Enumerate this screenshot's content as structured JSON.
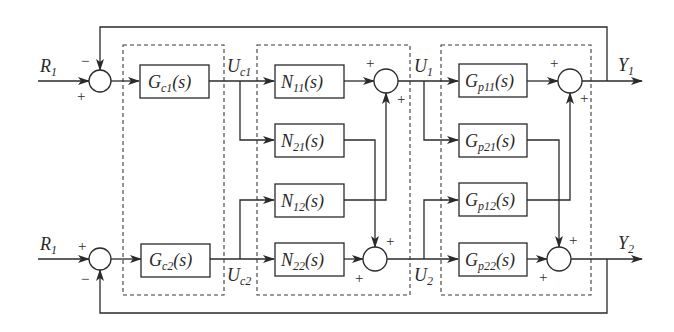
{
  "inputs": [
    {
      "id": "r1_top",
      "main": "R",
      "sub": "1"
    },
    {
      "id": "r1_bottom",
      "main": "R",
      "sub": "1"
    }
  ],
  "outputs": [
    {
      "id": "y1",
      "main": "Y",
      "sub": "1"
    },
    {
      "id": "y2",
      "main": "Y",
      "sub": "2"
    }
  ],
  "signals": {
    "uc1": {
      "main": "U",
      "sub": "c1"
    },
    "uc2": {
      "main": "U",
      "sub": "c2"
    },
    "u1": {
      "main": "U",
      "sub": "1"
    },
    "u2": {
      "main": "U",
      "sub": "2"
    }
  },
  "controller_blocks": [
    {
      "main": "G",
      "sub": "c1",
      "arg": "(s)"
    },
    {
      "main": "G",
      "sub": "c2",
      "arg": "(s)"
    }
  ],
  "decoupler_blocks": [
    {
      "main": "N",
      "sub": "11",
      "arg": "(s)"
    },
    {
      "main": "N",
      "sub": "21",
      "arg": "(s)"
    },
    {
      "main": "N",
      "sub": "12",
      "arg": "(s)"
    },
    {
      "main": "N",
      "sub": "22",
      "arg": "(s)"
    }
  ],
  "plant_blocks": [
    {
      "main": "G",
      "sub": "p11",
      "arg": "(s)"
    },
    {
      "main": "G",
      "sub": "p21",
      "arg": "(s)"
    },
    {
      "main": "G",
      "sub": "p12",
      "arg": "(s)"
    },
    {
      "main": "G",
      "sub": "p22",
      "arg": "(s)"
    }
  ],
  "summing_junction_signs": {
    "input1": {
      "top": "−",
      "left": "+"
    },
    "input2": {
      "left": "+",
      "bottom": "−"
    },
    "decoupler1": {
      "left": "+",
      "bottom": "+"
    },
    "decoupler2": {
      "top": "+",
      "left": "+"
    },
    "plant1": {
      "left": "+",
      "bottom": "+"
    },
    "plant2": {
      "top": "+",
      "left": "+"
    }
  },
  "colors": {
    "line": "#2a2a2a",
    "background": "#ffffff"
  }
}
